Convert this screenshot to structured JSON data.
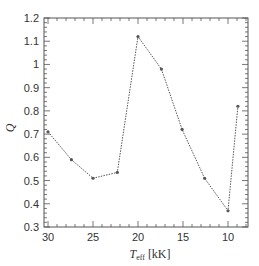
{
  "chart_data": {
    "type": "line",
    "title": "",
    "xlabel": "T_eff [kK]",
    "xlabel_main": "T",
    "xlabel_sub": "eff",
    "xlabel_unit": "[kK]",
    "ylabel": "Q",
    "xlim": [
      30.5,
      7.8
    ],
    "ylim": [
      0.3,
      1.2
    ],
    "x_inverted": true,
    "grid": false,
    "legend": null,
    "x_ticks": [
      30,
      25,
      20,
      15,
      10
    ],
    "x_tick_labels": [
      "30",
      "25",
      "20",
      "15",
      "10"
    ],
    "y_ticks": [
      0.3,
      0.4,
      0.5,
      0.6,
      0.7,
      0.8,
      0.9,
      1.0,
      1.1,
      1.2
    ],
    "y_tick_labels": [
      "0.3",
      "0.4",
      "0.5",
      "0.6",
      "0.7",
      "0.8",
      "0.9",
      "1",
      "1.1",
      "1.2"
    ],
    "series": [
      {
        "name": "Q",
        "style": "dotted line with small markers",
        "color": "#555555",
        "x": [
          30,
          27.4,
          25,
          22.3,
          20,
          17.4,
          15.1,
          12.6,
          10,
          8.9
        ],
        "values": [
          0.71,
          0.59,
          0.51,
          0.535,
          1.12,
          0.98,
          0.72,
          0.51,
          0.37,
          0.82
        ]
      }
    ]
  }
}
